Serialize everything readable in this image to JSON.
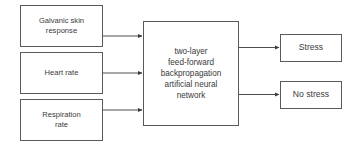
{
  "diagram": {
    "inputs": [
      {
        "label_lines": [
          "Galvanic skin",
          "response"
        ]
      },
      {
        "label_lines": [
          "Heart rate"
        ]
      },
      {
        "label_lines": [
          "Respiration",
          "rate"
        ]
      }
    ],
    "model": {
      "label_lines": [
        "two-layer",
        "feed-forward",
        "backpropagation",
        "artificial neural",
        "network"
      ]
    },
    "outputs": [
      {
        "label": "Stress"
      },
      {
        "label": "No stress"
      }
    ],
    "colors": {
      "border": "#5a5a5a",
      "text": "#3a3a3a",
      "arrow": "#3a3a3a",
      "background": "#ffffff"
    }
  }
}
